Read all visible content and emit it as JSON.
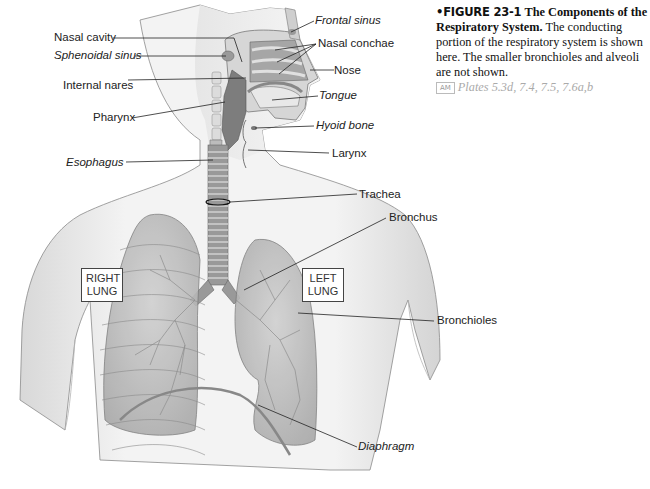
{
  "figure": {
    "number": "FIGURE 23-1",
    "bullet": "•",
    "title": "The Components of the Respiratory System.",
    "description": "The conducting portion of the respiratory system is shown here. The smaller bronchioles and alveoli are not shown.",
    "atlas_badge": "AM",
    "plates": "Plates 5.3d, 7.4, 7.5, 7.6a,b"
  },
  "labels": {
    "nasal_cavity": "Nasal cavity",
    "sphenoidal_sinus": "Sphenoidal sinus",
    "internal_nares": "Internal nares",
    "pharynx": "Pharynx",
    "esophagus": "Esophagus",
    "frontal_sinus": "Frontal sinus",
    "nasal_conchae": "Nasal conchae",
    "nose": "Nose",
    "tongue": "Tongue",
    "hyoid_bone": "Hyoid bone",
    "larynx": "Larynx",
    "trachea": "Trachea",
    "bronchus": "Bronchus",
    "bronchioles": "Bronchioles",
    "diaphragm": "Diaphragm"
  },
  "lung_boxes": {
    "right": {
      "line1": "RIGHT",
      "line2": "LUNG"
    },
    "left": {
      "line1": "LEFT",
      "line2": "LUNG"
    }
  },
  "colors": {
    "skin": "#eeeeee",
    "skin_shadow": "#c9c9c9",
    "lung": "#b9b9b9",
    "airway": "#7d7d7d",
    "leader_line": "#222222",
    "plates_text": "#aaaaaa"
  }
}
